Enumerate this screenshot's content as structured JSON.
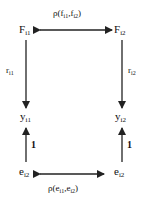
{
  "diagram": {
    "nodes": {
      "F1": {
        "base": "F",
        "sub": "i1"
      },
      "F2": {
        "base": "F",
        "sub": "i2"
      },
      "y1": {
        "base": "y",
        "sub": "i1"
      },
      "y2": {
        "base": "y",
        "sub": "i2"
      },
      "e1": {
        "base": "e",
        "sub": "i2"
      },
      "e2": {
        "base": "e",
        "sub": "i2"
      }
    },
    "edges": {
      "top": {
        "prefix": "ρ(f",
        "s1": "i1",
        "mid": ",f",
        "s2": "i2",
        "suffix": ")"
      },
      "bottom": {
        "prefix": "ρ(e",
        "s1": "i1",
        "mid": ",e",
        "s2": "i2",
        "suffix": ")"
      },
      "left_load": {
        "base": "r",
        "sub": "i1"
      },
      "right_load": {
        "base": "r",
        "sub": "i2"
      },
      "left_error": "1",
      "right_error": "1"
    },
    "colors": {
      "line": "#222222",
      "background": "#ffffff"
    }
  }
}
